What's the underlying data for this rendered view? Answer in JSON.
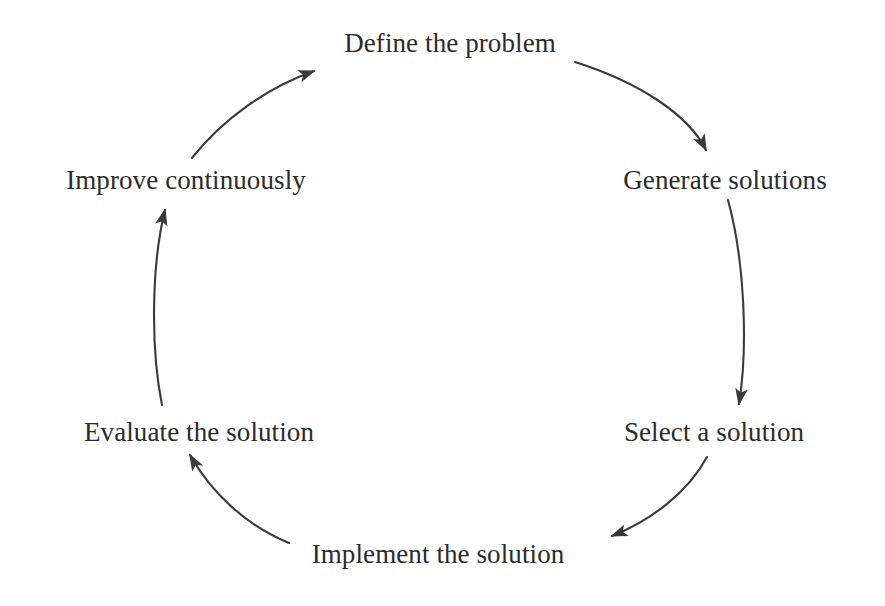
{
  "diagram": {
    "type": "cycle",
    "direction": "clockwise",
    "background_color": "#ffffff",
    "text_color": "#2b2b2b",
    "stroke_color": "#3a3a3a",
    "nodes": [
      {
        "id": "define",
        "label": "Define the problem",
        "x": 450,
        "y": 44,
        "angle_deg": 270
      },
      {
        "id": "generate",
        "label": "Generate solutions",
        "x": 725,
        "y": 181,
        "angle_deg": 330
      },
      {
        "id": "select",
        "label": "Select a solution",
        "x": 714,
        "y": 433,
        "angle_deg": 30
      },
      {
        "id": "implement",
        "label": "Implement the solution",
        "x": 438,
        "y": 555,
        "angle_deg": 90
      },
      {
        "id": "evaluate",
        "label": "Evaluate the solution",
        "x": 199,
        "y": 433,
        "angle_deg": 150
      },
      {
        "id": "improve",
        "label": "Improve continuously",
        "x": 186,
        "y": 181,
        "angle_deg": 210
      }
    ],
    "arrows": [
      {
        "id": "define-to-generate",
        "from": "define",
        "to": "generate",
        "path": "M 575 62 C 638 82 688 114 706 150"
      },
      {
        "id": "generate-to-select",
        "from": "generate",
        "to": "select",
        "path": "M 728 200 C 745 262 748 348 739 404"
      },
      {
        "id": "select-to-implement",
        "from": "select",
        "to": "implement",
        "path": "M 707 457 C 688 492 652 520 612 536"
      },
      {
        "id": "implement-to-evaluate",
        "from": "implement",
        "to": "evaluate",
        "path": "M 289 543 C 245 525 211 492 190 455"
      },
      {
        "id": "evaluate-to-improve",
        "from": "evaluate",
        "to": "improve",
        "path": "M 162 405 C 150 345 152 262 165 210"
      },
      {
        "id": "improve-to-define",
        "from": "improve",
        "to": "define",
        "path": "M 192 158 C 222 120 266 88 314 71"
      }
    ]
  }
}
